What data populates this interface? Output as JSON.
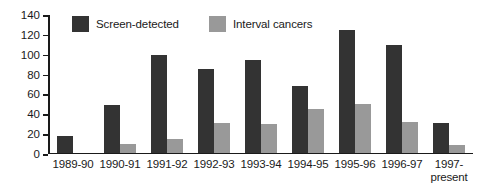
{
  "chart_data": {
    "type": "bar",
    "title": "",
    "xlabel": "",
    "ylabel": "",
    "ylim": [
      0,
      140
    ],
    "ytick_step": 20,
    "yticks": [
      140,
      120,
      100,
      80,
      60,
      40,
      20,
      0
    ],
    "grid": false,
    "legend_position": "top-inside",
    "categories": [
      "1989-90",
      "1990-91",
      "1991-92",
      "1992-93",
      "1993-94",
      "1994-95",
      "1995-96",
      "1996-97",
      "1997-present"
    ],
    "category_lines": [
      [
        "1989-90",
        ""
      ],
      [
        "1990-91",
        ""
      ],
      [
        "1991-92",
        ""
      ],
      [
        "1992-93",
        ""
      ],
      [
        "1993-94",
        ""
      ],
      [
        "1994-95",
        ""
      ],
      [
        "1995-96",
        ""
      ],
      [
        "1996-97",
        ""
      ],
      [
        "1997-",
        "present"
      ]
    ],
    "series": [
      {
        "name": "Screen-detected",
        "color": "#333333",
        "values": [
          17,
          48,
          98,
          84,
          93,
          67,
          123,
          108,
          30
        ]
      },
      {
        "name": "Interval cancers",
        "color": "#999999",
        "values": [
          0,
          9,
          14,
          30,
          29,
          44,
          49,
          31,
          8
        ]
      }
    ]
  },
  "legend": {
    "entries": [
      {
        "label": "Screen-detected",
        "color": "#333333",
        "swatch_name": "legend-swatch-screen-detected"
      },
      {
        "label": "Interval cancers",
        "color": "#999999",
        "swatch_name": "legend-swatch-interval-cancers"
      }
    ]
  },
  "colors": {
    "screen_detected": "#333333",
    "interval_cancers": "#999999",
    "axis": "#1a1a1a",
    "background": "#ffffff"
  }
}
